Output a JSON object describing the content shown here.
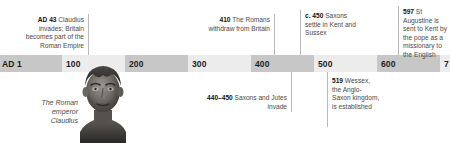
{
  "timeline": {
    "title": "Roman and Anglo-Saxon Britain timeline",
    "axis": {
      "start": "AD 1",
      "end": "700",
      "ticks": [
        {
          "label": "AD 1",
          "value": 1
        },
        {
          "label": "100",
          "value": 100
        },
        {
          "label": "200",
          "value": 200
        },
        {
          "label": "300",
          "value": 300
        },
        {
          "label": "400",
          "value": 400
        },
        {
          "label": "500",
          "value": 500
        },
        {
          "label": "600",
          "value": 600
        },
        {
          "label": "7",
          "value": 700
        }
      ],
      "band_colors": {
        "dark": "#c7c7c7",
        "light": "#ececec"
      }
    },
    "events_above": [
      {
        "date": "AD 43",
        "text": " Claudius invades; Britain becomes part of the Roman Empire",
        "year": 43
      },
      {
        "date": "410",
        "text": " The Romans withdraw from Britain",
        "year": 410
      },
      {
        "date": "c. 450",
        "text": " Saxons settle in Kent and Sussex",
        "year": 450
      },
      {
        "date": "597",
        "text": " St Augustine is sent to Kent by the pope as a missionary to the English",
        "year": 597
      }
    ],
    "events_below": [
      {
        "date": "440–450",
        "text": " Saxons and Jutes invade",
        "year": 445
      },
      {
        "date": "519",
        "text": " Wessex, the Anglo-Saxon kingdom, is established",
        "year": 519
      }
    ],
    "figure": {
      "caption_line1": "The Roman",
      "caption_line2": "emperor Claudius",
      "alt": "bust-of-emperor-claudius"
    }
  }
}
